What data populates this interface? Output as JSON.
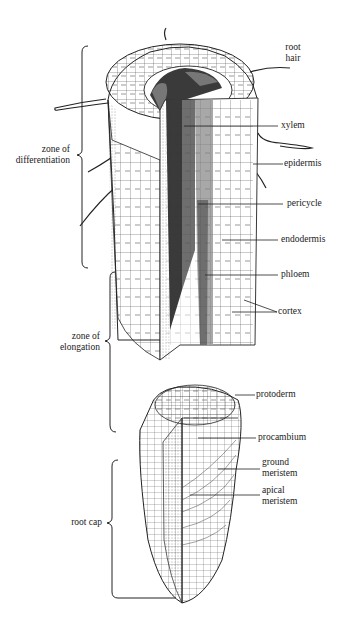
{
  "figure": {
    "colors": {
      "ink": "#1a1a1a",
      "background": "#ffffff",
      "vascular_dark": "#3a3a3a",
      "vascular_mid": "#6e6e6e",
      "vascular_light": "#a8a8a8"
    }
  },
  "labels": {
    "root_hair": [
      "root",
      "hair"
    ],
    "xylem": "xylem",
    "epidermis": "epidermis",
    "pericycle": "pericycle",
    "endodermis": "endodermis",
    "phloem": "phloem",
    "cortex": "cortex",
    "protoderm": "protoderm",
    "procambium": "procambium",
    "ground_meristem": [
      "ground",
      "meristem"
    ],
    "apical_meristem": [
      "apical",
      "meristem"
    ]
  },
  "zones": {
    "differentiation": [
      "zone of",
      "differentiation"
    ],
    "elongation": [
      "zone of",
      "elongation"
    ],
    "root_cap": "root cap"
  }
}
